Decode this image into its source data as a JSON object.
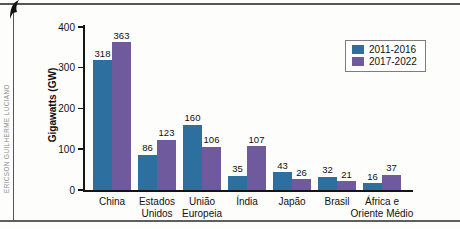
{
  "credit": "ERICSON GUILHERME LUCIANO",
  "chart_data": {
    "type": "bar",
    "title": "",
    "xlabel": "",
    "ylabel": "Gigawatts (GW)",
    "ylim": [
      0,
      400
    ],
    "y_ticks": [
      0,
      100,
      200,
      300,
      400
    ],
    "grid": false,
    "legend_position": "top-right",
    "categories": [
      "China",
      "Estados\nUnidos",
      "União\nEuropeia",
      "Índia",
      "Japão",
      "Brasil",
      "África e\nOriente Médio"
    ],
    "series": [
      {
        "name": "2011-2016",
        "color": "#2d6f9e",
        "values": [
          318,
          86,
          160,
          35,
          43,
          32,
          16
        ]
      },
      {
        "name": "2017-2022",
        "color": "#6f5a9d",
        "values": [
          363,
          123,
          106,
          107,
          26,
          21,
          37
        ]
      }
    ]
  }
}
